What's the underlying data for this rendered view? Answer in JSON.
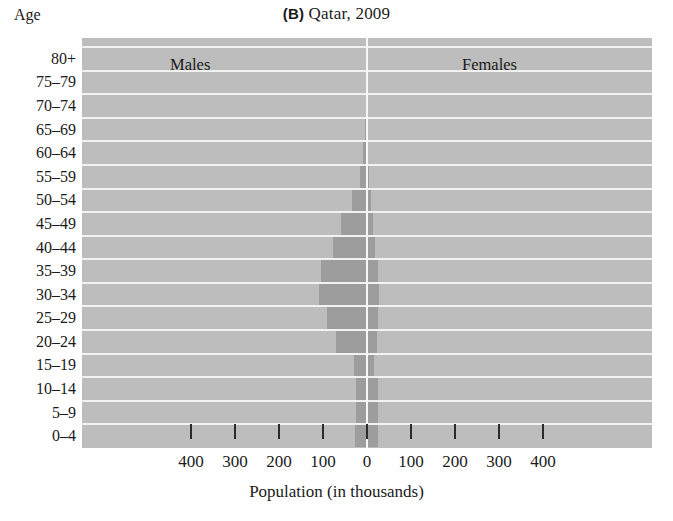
{
  "figure": {
    "panel_letter": "(B)",
    "title": "Qatar, 2009",
    "age_axis_caption": "Age",
    "xaxis_title": "Population (in thousands)",
    "male_label": "Males",
    "female_label": "Females",
    "colors": {
      "plot_background": "#bdbdbd",
      "bar_fill": "#9d9d9d",
      "gridline": "#f2f2f2",
      "zero_line": "#f7f7f7",
      "text": "#1a1a1a",
      "page_background": "#ffffff"
    }
  },
  "chart_data": {
    "type": "bar",
    "subtype": "population-pyramid",
    "title": "(B) Qatar, 2009",
    "xlabel": "Population (in thousands)",
    "ylabel": "Age",
    "xlim": [
      -400,
      400
    ],
    "xticks": [
      -400,
      -300,
      -200,
      -100,
      0,
      100,
      200,
      300,
      400
    ],
    "xticklabels": [
      "400",
      "300",
      "200",
      "100",
      "0",
      "100",
      "200",
      "300",
      "400"
    ],
    "grid": true,
    "legend": "inline-labels",
    "categories": [
      "80+",
      "75–79",
      "70–74",
      "65–69",
      "60–64",
      "55–59",
      "50–54",
      "45–49",
      "40–44",
      "35–39",
      "30–34",
      "25–29",
      "20–24",
      "15–19",
      "10–14",
      "5–9",
      "0–4"
    ],
    "series": [
      {
        "name": "Males",
        "side": "left",
        "values": [
          1,
          1,
          2,
          4,
          8,
          16,
          33,
          58,
          78,
          104,
          110,
          92,
          70,
          30,
          26,
          25,
          27
        ]
      },
      {
        "name": "Females",
        "side": "right",
        "values": [
          1,
          1,
          1,
          2,
          3,
          5,
          9,
          14,
          19,
          25,
          27,
          26,
          22,
          17,
          24,
          24,
          26
        ]
      }
    ],
    "units": "thousands"
  },
  "axis": {
    "bands": [
      {
        "label": "80+"
      },
      {
        "label": "75–79"
      },
      {
        "label": "70–74"
      },
      {
        "label": "65–69"
      },
      {
        "label": "60–64"
      },
      {
        "label": "55–59"
      },
      {
        "label": "50–54"
      },
      {
        "label": "45–49"
      },
      {
        "label": "40–44"
      },
      {
        "label": "35–39"
      },
      {
        "label": "30–34"
      },
      {
        "label": "25–29"
      },
      {
        "label": "20–24"
      },
      {
        "label": "15–19"
      },
      {
        "label": "10–14"
      },
      {
        "label": "5–9"
      },
      {
        "label": "0–4"
      }
    ]
  }
}
